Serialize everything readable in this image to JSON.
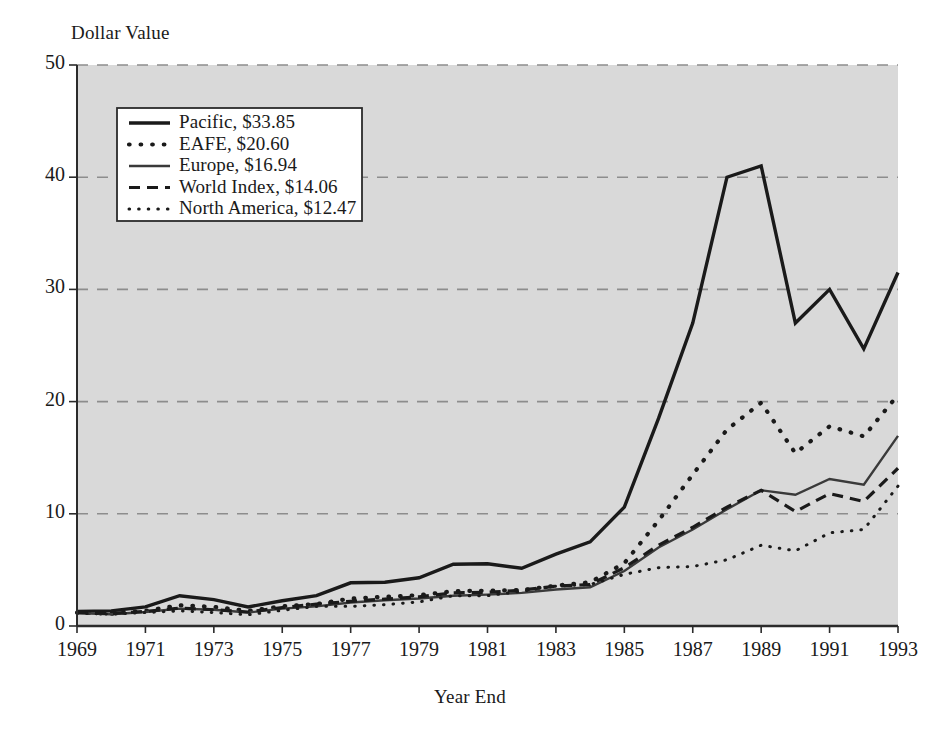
{
  "chart_data": {
    "type": "line",
    "title": "",
    "xlabel": "Year End",
    "ylabel": "Dollar Value",
    "xlim": [
      1969,
      1993
    ],
    "ylim": [
      0,
      50
    ],
    "ytick_labels": [
      "0",
      "10",
      "20",
      "30",
      "40",
      "50"
    ],
    "yticks": [
      0,
      10,
      20,
      30,
      40,
      50
    ],
    "xtick_labels": [
      "1969",
      "1971",
      "1973",
      "1975",
      "1977",
      "1979",
      "1981",
      "1983",
      "1985",
      "1987",
      "1989",
      "1991",
      "1993"
    ],
    "xticks": [
      1969,
      1971,
      1973,
      1975,
      1977,
      1979,
      1981,
      1983,
      1985,
      1987,
      1989,
      1991,
      1993
    ],
    "x": [
      1969,
      1970,
      1971,
      1972,
      1973,
      1974,
      1975,
      1976,
      1977,
      1978,
      1979,
      1980,
      1981,
      1982,
      1983,
      1984,
      1985,
      1986,
      1987,
      1988,
      1989,
      1990,
      1991,
      1992,
      1993
    ],
    "grid": "horizontal-dashed",
    "plot_background": "#d9d9d9",
    "legend_position": "upper-left",
    "series": [
      {
        "name": "Pacific",
        "end_value": "$33.85",
        "legend_label": "Pacific, $33.85",
        "style": "solid-thick",
        "color": "#1a1a1a",
        "values": [
          1.3,
          1.35,
          1.7,
          2.7,
          2.35,
          1.7,
          2.25,
          2.7,
          3.85,
          3.9,
          4.3,
          5.5,
          5.55,
          5.15,
          6.4,
          7.5,
          10.6,
          18.5,
          27.0,
          40.0,
          41.0,
          27.0,
          30.0,
          24.7,
          31.5
        ]
      },
      {
        "name": "EAFE",
        "end_value": "$20.60",
        "legend_label": "EAFE, $20.60",
        "style": "dotted-coarse",
        "color": "#1a1a1a",
        "values": [
          1.2,
          1.1,
          1.35,
          1.85,
          1.7,
          1.35,
          1.75,
          1.95,
          2.45,
          2.6,
          2.75,
          3.1,
          3.15,
          3.2,
          3.6,
          3.9,
          5.6,
          9.4,
          13.5,
          17.5,
          19.9,
          15.4,
          17.8,
          16.9,
          20.6
        ]
      },
      {
        "name": "Europe",
        "end_value": "$16.94",
        "legend_label": "Europe, $16.94",
        "style": "solid-medium",
        "color": "#3a3a3a",
        "values": [
          1.15,
          1.05,
          1.25,
          1.55,
          1.45,
          1.2,
          1.55,
          1.75,
          2.1,
          2.3,
          2.45,
          2.7,
          2.8,
          2.95,
          3.25,
          3.45,
          4.9,
          7.0,
          8.6,
          10.4,
          12.1,
          11.7,
          13.1,
          12.6,
          16.94
        ]
      },
      {
        "name": "World Index",
        "end_value": "$14.06",
        "legend_label": "World Index, $14.06",
        "style": "dashed",
        "color": "#1a1a1a",
        "values": [
          1.2,
          1.12,
          1.3,
          1.6,
          1.45,
          1.25,
          1.65,
          1.95,
          2.2,
          2.4,
          2.6,
          2.95,
          3.0,
          3.2,
          3.55,
          3.7,
          5.2,
          7.2,
          8.8,
          10.6,
          12.1,
          10.2,
          11.8,
          11.1,
          14.06
        ]
      },
      {
        "name": "North America",
        "end_value": "$12.47",
        "legend_label": "North America, $12.47",
        "style": "dotted-fine",
        "color": "#1a1a1a",
        "values": [
          1.15,
          1.05,
          1.2,
          1.35,
          1.2,
          1.0,
          1.4,
          1.75,
          1.75,
          1.9,
          2.15,
          2.7,
          2.7,
          3.1,
          3.55,
          3.7,
          4.6,
          5.2,
          5.3,
          5.9,
          7.2,
          6.7,
          8.3,
          8.6,
          12.47
        ]
      }
    ]
  }
}
